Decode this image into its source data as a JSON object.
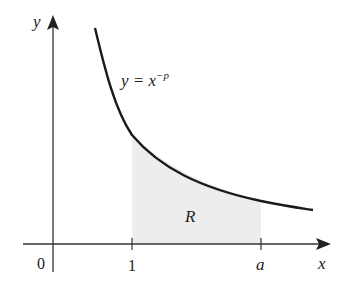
{
  "diagram": {
    "axes": {
      "x_label": "x",
      "y_label": "y",
      "origin_label": "0"
    },
    "ticks": {
      "one": "1",
      "a": "a"
    },
    "curve_label": {
      "lhs": "y = x",
      "exponent": "−p"
    },
    "region_label": "R",
    "colors": {
      "curve": "#1a1a1a",
      "axis": "#333333",
      "region": "#ededed"
    }
  }
}
